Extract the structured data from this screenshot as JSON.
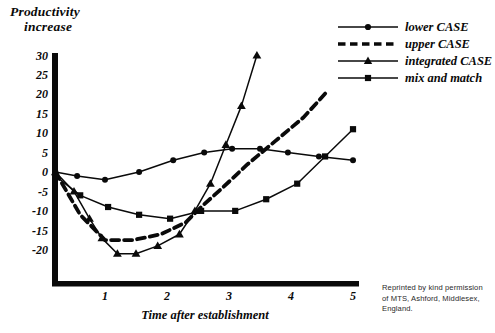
{
  "figure": {
    "y_axis_caption_line1": "Productivity",
    "y_axis_caption_line2": "increase",
    "x_axis_title": "Time after establishment",
    "credit_line1": "Reprinted by kind permission",
    "credit_line2": "of MTS, Ashford, Middlesex,",
    "credit_line3": "England.",
    "ink_color": "#0a0a0a",
    "background_color": "#ffffff"
  },
  "chart_data": {
    "type": "line",
    "title": "",
    "xlabel": "Time after establishment",
    "ylabel": "Productivity increase",
    "xlim": [
      0,
      5
    ],
    "ylim": [
      -20,
      30
    ],
    "xticks": [
      1,
      2,
      3,
      4,
      5
    ],
    "yticks": [
      30,
      25,
      20,
      15,
      10,
      5,
      0,
      -5,
      -10,
      -15,
      -20
    ],
    "xtick_labels": [
      "1",
      "2",
      "3",
      "4",
      "5"
    ],
    "ytick_labels": [
      "30",
      "25",
      "20",
      "15",
      "10",
      "5",
      "0",
      "-5",
      "-10",
      "-15",
      "-20"
    ],
    "grid": false,
    "legend_position": "upper right",
    "series": [
      {
        "name": "lower CASE",
        "marker": "circle",
        "line_style": "solid",
        "x": [
          0.2,
          0.55,
          1.0,
          1.55,
          2.1,
          2.6,
          3.05,
          3.5,
          3.95,
          4.45,
          5.0
        ],
        "y": [
          0.0,
          -1.0,
          -2.0,
          0.0,
          3.0,
          5.0,
          6.0,
          6.0,
          5.0,
          4.0,
          3.0
        ]
      },
      {
        "name": "upper CASE",
        "marker": "none",
        "line_style": "dashed",
        "x": [
          0.2,
          0.6,
          1.0,
          1.45,
          1.9,
          2.3,
          2.55,
          2.9,
          3.3,
          3.75,
          4.2,
          4.6
        ],
        "y": [
          0.0,
          -11.0,
          -17.5,
          -17.5,
          -16.0,
          -13.0,
          -9.0,
          -4.0,
          2.0,
          8.0,
          14.0,
          21.0
        ]
      },
      {
        "name": "integrated CASE",
        "marker": "triangle",
        "line_style": "solid",
        "x": [
          0.2,
          0.5,
          0.75,
          0.95,
          1.2,
          1.5,
          1.85,
          2.2,
          2.45,
          2.7,
          2.95,
          3.2,
          3.45
        ],
        "y": [
          0.0,
          -5.0,
          -12.0,
          -17.0,
          -21.0,
          -21.0,
          -19.0,
          -16.0,
          -10.0,
          -3.0,
          7.0,
          17.0,
          30.0
        ]
      },
      {
        "name": "mix and match",
        "marker": "square",
        "line_style": "solid",
        "x": [
          0.2,
          0.6,
          1.05,
          1.55,
          2.05,
          2.55,
          3.1,
          3.6,
          4.1,
          4.55,
          5.0
        ],
        "y": [
          -1.0,
          -6.0,
          -9.0,
          -11.0,
          -12.0,
          -10.0,
          -10.0,
          -7.0,
          -3.0,
          4.0,
          11.0
        ]
      }
    ]
  },
  "legend": {
    "items": [
      {
        "label": "lower CASE",
        "marker": "circle",
        "line_style": "solid"
      },
      {
        "label": "upper CASE",
        "marker": "none",
        "line_style": "dashed"
      },
      {
        "label": "integrated CASE",
        "marker": "triangle",
        "line_style": "solid"
      },
      {
        "label": "mix and match",
        "marker": "square",
        "line_style": "solid"
      }
    ]
  }
}
